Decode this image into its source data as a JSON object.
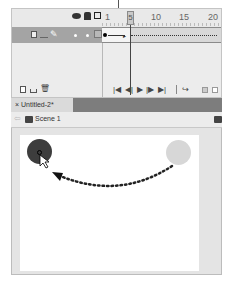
{
  "timeline": {
    "ruler": {
      "labels": [
        "1",
        "5",
        "10",
        "15",
        "20"
      ],
      "current_frame": "5"
    },
    "header_icons": [
      "eye-icon",
      "lock-icon",
      "outline-icon"
    ],
    "layer_icons": [
      "layer-icon",
      "pencil-icon",
      "dot-visible",
      "dot-lock",
      "outline-square"
    ],
    "footer_left_icons": [
      "new-layer-icon",
      "new-folder-icon",
      "delete-icon"
    ],
    "playback": {
      "first": "|◀",
      "prev": "◀|",
      "play": "▶",
      "next": "|▶",
      "last": "▶|",
      "loop": "loop-icon"
    }
  },
  "document": {
    "tab_label": "× Untitled-2*",
    "scene_label": "Scene 1"
  },
  "stage": {
    "colors": {
      "ball_start": "#3d3d3d",
      "ball_end": "#d7d7d7",
      "motion_path": "#222222"
    }
  }
}
